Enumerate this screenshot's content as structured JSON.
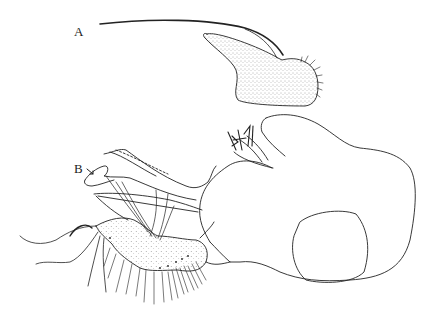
{
  "figure": {
    "type": "scientific line illustration",
    "panels": [
      {
        "label": "A",
        "description": "detached elongate sclerite with long whip-like filament and setose apex"
      },
      {
        "label": "B",
        "description": "full structure in lateral view with arrow pointing to process"
      }
    ],
    "colors": {
      "ink": "#222222",
      "background": "#ffffff",
      "stipple": "#555555"
    }
  }
}
